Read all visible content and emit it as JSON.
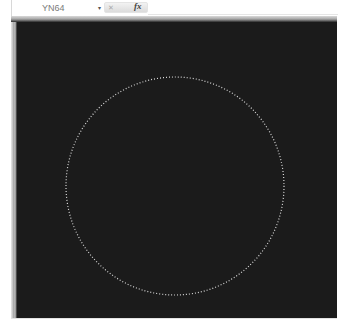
{
  "formula_bar": {
    "name_box_value": "YN64",
    "dropdown_glyph": "▾",
    "cancel_glyph": "✕",
    "fx_label": "fx"
  },
  "canvas": {
    "background": "#1b1b1b",
    "shape": "circle",
    "shape_style": "dotted",
    "shape_color": "#d8d8d8",
    "center_x": 175,
    "center_y": 186,
    "radius": 109
  }
}
